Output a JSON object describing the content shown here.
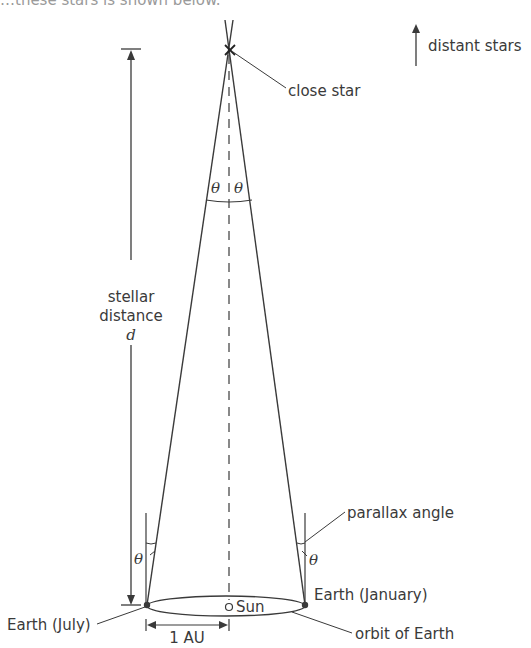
{
  "header": {
    "cut_off_caption": "…these stars is shown below."
  },
  "labels": {
    "distant_stars": "distant stars",
    "close_star": "close star",
    "theta": "θ",
    "stellar": "stellar",
    "distance": "distance",
    "d": "d",
    "parallax_angle": "parallax angle",
    "earth_july": "Earth (July)",
    "earth_january": "Earth (January)",
    "sun": "Sun",
    "one_au": "1 AU",
    "orbit_of_earth": "orbit of Earth"
  },
  "colors": {
    "line": "#3a3a3a",
    "text": "#3a3a3a"
  }
}
